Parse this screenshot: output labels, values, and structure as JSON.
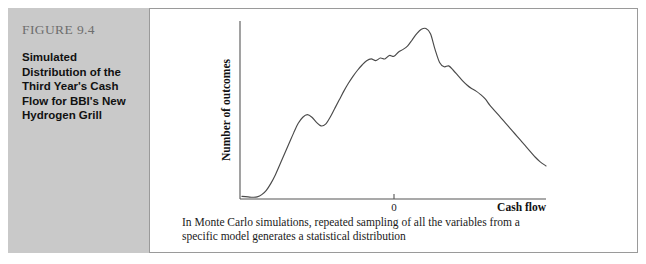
{
  "sidebar": {
    "figure_number": "FIGURE 9.4",
    "title_lines": [
      "Simulated",
      "Distribution of the",
      "Third Year's Cash",
      "Flow for BBI's New",
      "Hydrogen Grill"
    ],
    "panel_color": "#c9c9c9",
    "figure_number_color": "#6e6e6e"
  },
  "caption": {
    "lines": [
      "In Monte Carlo simulations, repeated sampling of all the variables from a",
      "specific model generates a statistical distribution"
    ]
  },
  "chart_data": {
    "type": "line",
    "title": "",
    "xlabel": "Cash flow",
    "ylabel": "Number of outcomes",
    "xticks": [
      "0"
    ],
    "xtick_positions": [
      0
    ],
    "yticks": [],
    "grid": false,
    "legend": null,
    "line_color": "#4a4a4a",
    "axis_color": "#555555",
    "xlim": [
      -1.0,
      1.0
    ],
    "ylim": [
      0,
      100
    ],
    "series": [
      {
        "name": "Simulated third-year cash flow distribution",
        "x": [
          -1.0,
          -0.96,
          -0.93,
          -0.9,
          -0.87,
          -0.84,
          -0.81,
          -0.78,
          -0.75,
          -0.72,
          -0.69,
          -0.66,
          -0.63,
          -0.6,
          -0.57,
          -0.54,
          -0.51,
          -0.48,
          -0.45,
          -0.42,
          -0.39,
          -0.36,
          -0.33,
          -0.3,
          -0.27,
          -0.24,
          -0.21,
          -0.18,
          -0.15,
          -0.12,
          -0.09,
          -0.06,
          -0.03,
          0.0,
          0.03,
          0.06,
          0.09,
          0.12,
          0.15,
          0.18,
          0.21,
          0.24,
          0.27,
          0.3,
          0.33,
          0.36,
          0.39,
          0.42,
          0.45,
          0.48,
          0.51,
          0.54,
          0.57,
          0.6,
          0.63,
          0.66,
          0.69,
          0.72,
          0.75,
          0.78,
          0.81,
          0.84,
          0.87,
          0.9,
          0.93,
          0.96,
          1.0
        ],
        "y": [
          1.5,
          1.2,
          1.0,
          1.2,
          2.5,
          5.0,
          9.0,
          14.0,
          20.0,
          26.0,
          32.0,
          38.0,
          43.5,
          47.0,
          48.5,
          47.0,
          44.0,
          42.0,
          43.0,
          47.0,
          52.0,
          57.0,
          62.0,
          66.5,
          70.5,
          74.0,
          77.0,
          79.5,
          80.5,
          79.5,
          81.0,
          80.5,
          82.5,
          82.0,
          84.5,
          86.0,
          88.0,
          91.5,
          95.0,
          97.5,
          98.0,
          95.0,
          86.0,
          78.5,
          76.0,
          76.5,
          74.0,
          71.0,
          68.0,
          65.5,
          63.5,
          62.0,
          60.0,
          57.5,
          54.0,
          51.0,
          48.0,
          45.0,
          42.0,
          39.0,
          36.0,
          33.0,
          30.0,
          27.0,
          24.0,
          21.5,
          19.0
        ]
      }
    ]
  }
}
